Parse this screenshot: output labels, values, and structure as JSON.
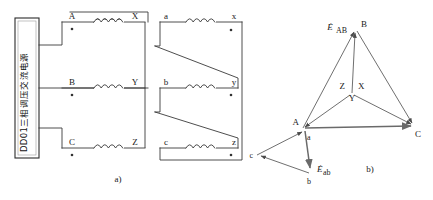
{
  "figure": {
    "caption_a": "a)",
    "caption_b": "b)"
  },
  "source_box": {
    "label": "DD01三相调压交流电源",
    "name": "three-phase-variable-ac-source"
  },
  "circuit": {
    "primary": {
      "name": "primary-delta-winding",
      "phases": [
        {
          "start": "A",
          "end": "X",
          "polarity_dot": "start"
        },
        {
          "start": "B",
          "end": "Y",
          "polarity_dot": "start"
        },
        {
          "start": "C",
          "end": "Z",
          "polarity_dot": "start"
        }
      ]
    },
    "secondary": {
      "name": "secondary-delta-winding",
      "phases": [
        {
          "start": "a",
          "end": "x",
          "polarity_dot": "end"
        },
        {
          "start": "b",
          "end": "y",
          "polarity_dot": "end"
        },
        {
          "start": "c",
          "end": "z",
          "polarity_dot": "end"
        }
      ]
    }
  },
  "phasor": {
    "name": "phasor-diagram",
    "primary_vertices": [
      "A",
      "B",
      "C"
    ],
    "primary_neutral_labels": [
      "Z",
      "X",
      "Y"
    ],
    "secondary_vertices": [
      "a",
      "b",
      "c"
    ],
    "vector_labels": {
      "primary": "Ė",
      "primary_sub": "AB",
      "secondary": "Ė",
      "secondary_sub": "ab"
    }
  }
}
